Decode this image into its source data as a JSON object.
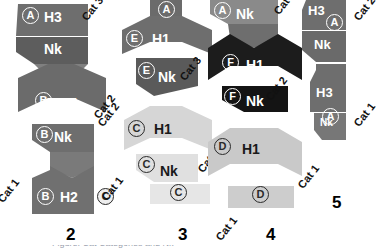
{
  "figure": {
    "type": "category-chain-diagram",
    "background": "#ffffff",
    "width": 383,
    "height": 252,
    "caption_fragment": "Figure:  Cat  Categories  and  Nk"
  },
  "palette": {
    "mid_gray": "#6e6e6e",
    "dark_gray": "#585858",
    "darker_gray": "#4a4a4a",
    "light_gray": "#c9c9c9",
    "lighter_gray": "#d9d9d9",
    "very_light_gray": "#e6e6e6",
    "near_black": "#1c1c1c",
    "black": "#111111",
    "white": "#ffffff",
    "text_dark": "#1a1a1a"
  },
  "columns": [
    {
      "number": "1",
      "blocks": [
        {
          "label": "H3",
          "badge": "A",
          "color": "#6e6e6e",
          "text": "light"
        },
        {
          "label": "Nk",
          "badge": "",
          "color": "#5d5d5d",
          "text": "light"
        },
        {
          "label": "H1",
          "badge": "B",
          "color": "#6b6b6b",
          "text": "light"
        },
        {
          "label": "Nk",
          "badge": "B",
          "color": "#6e6e6e",
          "text": "light"
        },
        {
          "label": "H2",
          "badge": "B",
          "color": "#707070",
          "text": "light"
        }
      ],
      "cats": [
        "Cat 3",
        "Cat 2",
        "Cat 1"
      ]
    },
    {
      "number": "2",
      "blocks": [
        {
          "label": "Nk",
          "badge": "B",
          "color": "#6e6e6e",
          "text": "light"
        },
        {
          "label": "H2",
          "badge": "B",
          "color": "#707070",
          "text": "light"
        }
      ],
      "cats": [
        "Cat 2",
        "Cat 1"
      ],
      "badges_right": [
        "C"
      ]
    },
    {
      "number": "3",
      "blocks": [
        {
          "label": "",
          "badge": "A",
          "color": "#6b6b6b",
          "text": "light"
        },
        {
          "label": "H1",
          "badge": "E",
          "color": "#6e6e6e",
          "text": "light"
        },
        {
          "label": "Nk",
          "badge": "E",
          "color": "#5a5a5a",
          "text": "light"
        },
        {
          "label": "H1",
          "badge": "C",
          "color": "#d6d6d6",
          "text": "dark"
        },
        {
          "label": "Nk",
          "badge": "C",
          "color": "#e0e0e0",
          "text": "dark"
        },
        {
          "label": "",
          "badge": "C",
          "color": "#e6e6e6",
          "text": "dark"
        }
      ],
      "cats": [
        "Cat 3",
        "Cat 2",
        "Cat 1"
      ]
    },
    {
      "number": "4",
      "blocks": [
        {
          "label": "Nk",
          "badge": "A",
          "color": "#8a8a8a",
          "text": "light"
        },
        {
          "label": "H1",
          "badge": "F",
          "color": "#1c1c1c",
          "text": "light"
        },
        {
          "label": "Nk",
          "badge": "F",
          "color": "#141414",
          "text": "light"
        },
        {
          "label": "H1",
          "badge": "D",
          "color": "#c9c9c9",
          "text": "dark"
        },
        {
          "label": "",
          "badge": "D",
          "color": "#cdcdcd",
          "text": "dark"
        }
      ],
      "cats": [
        "Cat 3",
        "Cat 2",
        "Cat 1"
      ]
    },
    {
      "number": "5",
      "blocks": [
        {
          "label": "H3",
          "badge": "A",
          "color": "#6e6e6e",
          "text": "light"
        },
        {
          "label": "Nk",
          "badge": "",
          "color": "#6a6a6a",
          "text": "light"
        },
        {
          "label": "H3",
          "badge": "A",
          "color": "#6e6e6e",
          "text": "light"
        },
        {
          "label": "Nk",
          "badge": "",
          "color": "#777777",
          "text": "light"
        }
      ],
      "cats": [
        "Cat 2",
        "Cat 1"
      ]
    }
  ],
  "labels": {
    "c1_b1": "H3",
    "c1_b2": "Nk",
    "c1_b3": "H1",
    "c1_badge_a": "A",
    "c1_badge_b": "B",
    "c1_cat3": "Cat 3",
    "c1_cat2": "Cat 2",
    "c1_cat1": "Cat 1",
    "c2_b1": "Nk",
    "c2_b2": "H2",
    "c2_badge_b1": "B",
    "c2_badge_b2": "B",
    "c2_badge_c": "C",
    "c2_cat2": "Cat 2",
    "c2_cat1": "Cat 1",
    "c2_num": "2",
    "c3_badge_a": "A",
    "c3_badge_e1": "E",
    "c3_badge_e2": "E",
    "c3_b_h1": "H1",
    "c3_b_nk": "Nk",
    "c3_cat3": "Cat 3",
    "c3_cat2": "Cat 2",
    "c3_cat1": "Cat 1",
    "c3_badge_c1": "C",
    "c3_badge_c2": "C",
    "c3_badge_c3": "C",
    "c3_b_h1b": "H1",
    "c3_b_nkb": "Nk",
    "c3_num": "3",
    "c4_badge_a": "A",
    "c4_b_nk_top": "Nk",
    "c4_badge_f1": "F",
    "c4_b_h1": "H1",
    "c4_badge_f2": "F",
    "c4_b_nk": "Nk",
    "c4_badge_d1": "D",
    "c4_b_h1b": "H1",
    "c4_badge_d2": "D",
    "c4_cat3": "Cat 3",
    "c4_cat2": "Cat 2",
    "c4_cat1": "Cat 1",
    "c4_num": "4",
    "c5_b_h3a": "H3",
    "c5_badge_a1": "A",
    "c5_b_nka": "Nk",
    "c5_b_h3b": "H3",
    "c5_badge_a2": "A",
    "c5_b_nkb": "Nk",
    "c5_cat2": "Cat 2",
    "c5_cat1": "Cat 1",
    "c5_num": "5"
  }
}
